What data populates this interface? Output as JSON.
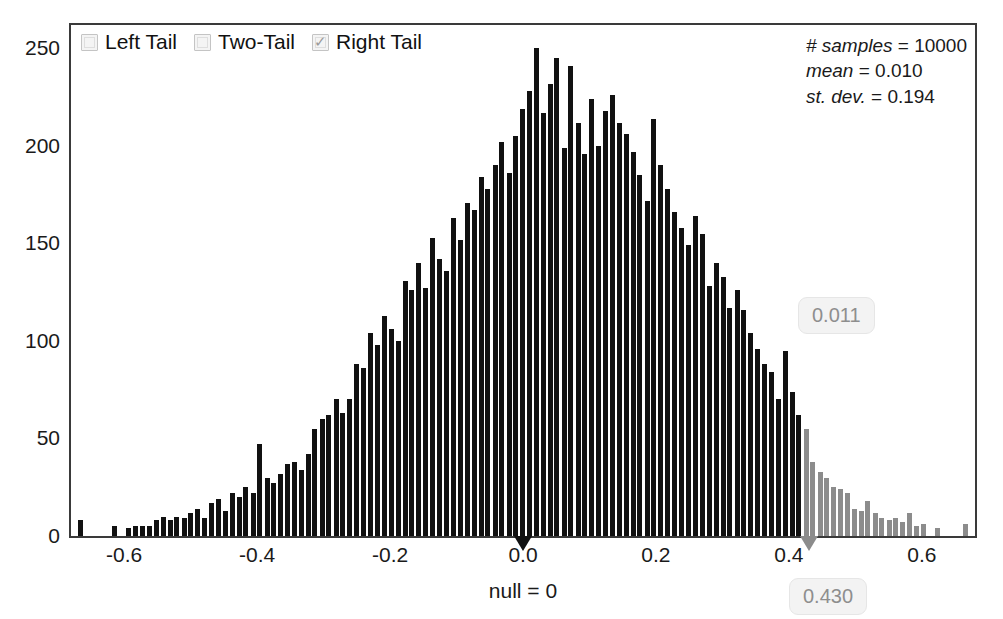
{
  "legend": {
    "items": [
      {
        "label": "Left Tail",
        "checked": false,
        "name": "left-tail"
      },
      {
        "label": "Two-Tail",
        "checked": false,
        "name": "two-tail"
      },
      {
        "label": "Right Tail",
        "checked": true,
        "name": "right-tail"
      }
    ],
    "check_glyph": "✓"
  },
  "stats": {
    "samples_key": "# samples",
    "samples_value": "= 10000",
    "mean_key": "mean",
    "mean_value": "= 0.010",
    "stdev_key": "st. dev.",
    "stdev_value": "= 0.194"
  },
  "annotations": {
    "null_caption": "null = 0",
    "pvalue_badge": "0.011",
    "observed_badge": "0.430"
  },
  "colors": {
    "bar_body": "#111111",
    "bar_tail": "#8c8c8c",
    "null_marker": "#111111",
    "observed_marker": "#8c8c8c",
    "frame": "#3a3a3a",
    "badge_text": "#8e8e8e"
  },
  "chart_data": {
    "type": "bar",
    "title": "",
    "xlabel": "",
    "ylabel": "",
    "subtitle": "Randomization distribution with right-tail test",
    "grid": false,
    "legend_position": "top-left",
    "xlim": [
      -0.68,
      0.68
    ],
    "ylim": [
      0,
      262
    ],
    "xticks": [
      -0.6,
      -0.4,
      -0.2,
      0.0,
      0.2,
      0.4,
      0.6
    ],
    "xticklabels": [
      "-0.6",
      "-0.4",
      "-0.2",
      "0.0",
      "0.2",
      "0.4",
      "0.6"
    ],
    "yticks": [
      0,
      50,
      100,
      150,
      200,
      250
    ],
    "yticklabels": [
      "0",
      "50",
      "100",
      "150",
      "200",
      "250"
    ],
    "null_value": 0,
    "observed_value": 0.43,
    "p_value": 0.011,
    "n_samples": 10000,
    "mean": 0.01,
    "st_dev": 0.194,
    "tail": "right",
    "bin_width": 0.0104,
    "x": [
      -0.666,
      -0.656,
      -0.645,
      -0.635,
      -0.625,
      -0.614,
      -0.604,
      -0.593,
      -0.583,
      -0.573,
      -0.562,
      -0.552,
      -0.541,
      -0.531,
      -0.521,
      -0.51,
      -0.5,
      -0.489,
      -0.479,
      -0.469,
      -0.458,
      -0.448,
      -0.437,
      -0.427,
      -0.417,
      -0.406,
      -0.396,
      -0.385,
      -0.375,
      -0.365,
      -0.354,
      -0.344,
      -0.333,
      -0.323,
      -0.313,
      -0.302,
      -0.292,
      -0.281,
      -0.271,
      -0.261,
      -0.25,
      -0.24,
      -0.229,
      -0.219,
      -0.209,
      -0.198,
      -0.188,
      -0.177,
      -0.167,
      -0.157,
      -0.146,
      -0.136,
      -0.125,
      -0.115,
      -0.105,
      -0.094,
      -0.084,
      -0.073,
      -0.063,
      -0.053,
      -0.042,
      -0.032,
      -0.021,
      -0.011,
      -0.001,
      0.01,
      0.02,
      0.031,
      0.041,
      0.051,
      0.062,
      0.072,
      0.083,
      0.093,
      0.103,
      0.114,
      0.124,
      0.135,
      0.145,
      0.155,
      0.166,
      0.176,
      0.187,
      0.197,
      0.207,
      0.218,
      0.228,
      0.239,
      0.249,
      0.259,
      0.27,
      0.28,
      0.291,
      0.301,
      0.311,
      0.322,
      0.332,
      0.343,
      0.353,
      0.363,
      0.374,
      0.384,
      0.395,
      0.405,
      0.415,
      0.426,
      0.436,
      0.447,
      0.457,
      0.467,
      0.478,
      0.488,
      0.499,
      0.509,
      0.519,
      0.53,
      0.54,
      0.551,
      0.561,
      0.571,
      0.582,
      0.592,
      0.603,
      0.613,
      0.623,
      0.634,
      0.644,
      0.655,
      0.665
    ],
    "values": [
      8,
      0,
      0,
      0,
      0,
      5,
      0,
      4,
      5,
      5,
      5,
      8,
      10,
      8,
      10,
      9,
      12,
      14,
      9,
      17,
      19,
      13,
      22,
      20,
      25,
      22,
      47,
      30,
      27,
      32,
      37,
      38,
      34,
      42,
      55,
      60,
      62,
      70,
      63,
      70,
      88,
      86,
      104,
      98,
      113,
      106,
      100,
      131,
      126,
      140,
      127,
      153,
      142,
      136,
      163,
      152,
      171,
      167,
      184,
      178,
      190,
      202,
      186,
      205,
      219,
      228,
      250,
      217,
      232,
      245,
      199,
      241,
      212,
      196,
      224,
      200,
      218,
      226,
      212,
      206,
      197,
      185,
      172,
      214,
      190,
      178,
      166,
      158,
      149,
      164,
      155,
      128,
      140,
      133,
      117,
      126,
      116,
      104,
      96,
      88,
      84,
      70,
      95,
      74,
      62,
      55,
      38,
      33,
      30,
      25,
      24,
      22,
      14,
      13,
      18,
      12,
      9,
      8,
      9,
      7,
      12,
      5,
      6,
      0,
      4,
      0,
      0,
      0,
      6
    ]
  }
}
